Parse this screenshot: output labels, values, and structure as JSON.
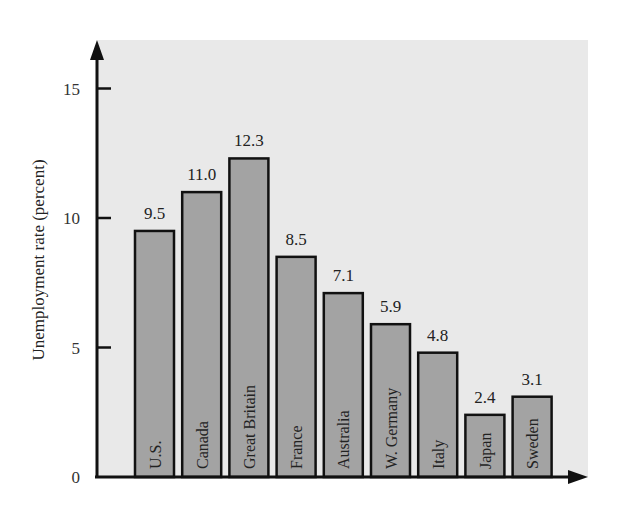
{
  "chart_data": {
    "type": "bar",
    "title": "",
    "xlabel": "",
    "ylabel": "Unemployment rate (percent)",
    "categories": [
      "U.S.",
      "Canada",
      "Great Britain",
      "France",
      "Australia",
      "W. Germany",
      "Italy",
      "Japan",
      "Sweden"
    ],
    "values": [
      9.5,
      11.0,
      12.3,
      8.5,
      7.1,
      5.9,
      4.8,
      2.4,
      3.1
    ],
    "value_labels": [
      "9.5",
      "11.0",
      "12.3",
      "8.5",
      "7.1",
      "5.9",
      "4.8",
      "2.4",
      "3.1"
    ],
    "yticks": [
      0,
      5,
      10,
      15
    ],
    "ytick_labels": [
      "0",
      "5",
      "10",
      "15"
    ],
    "ylim": [
      0,
      16.8
    ],
    "grid": false,
    "legend": null,
    "category_labels_inside_bars": true,
    "colors": {
      "bar_fill": "#a3a3a3",
      "bar_stroke": "#111111",
      "panel_background": "#e9e9e9",
      "page_background": "#ffffff"
    }
  }
}
